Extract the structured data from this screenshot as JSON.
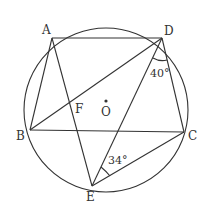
{
  "diagram": {
    "type": "inscribed-polygon",
    "circle": {
      "center_label": "O",
      "cx": 106,
      "cy": 110,
      "r": 82
    },
    "points": {
      "A": {
        "label": "A",
        "x": 52,
        "y": 38
      },
      "D": {
        "label": "D",
        "x": 162,
        "y": 38
      },
      "B": {
        "label": "B",
        "x": 30,
        "y": 130
      },
      "C": {
        "label": "C",
        "x": 184,
        "y": 132
      },
      "E": {
        "label": "E",
        "x": 92,
        "y": 186
      },
      "F": {
        "label": "F"
      }
    },
    "segments": [
      "AD",
      "AB",
      "AE",
      "BD",
      "BC",
      "DC",
      "DE",
      "EC"
    ],
    "angles": [
      {
        "vertex": "D",
        "between": [
          "E",
          "C"
        ],
        "value": "40°"
      },
      {
        "vertex": "E",
        "between": [
          "D",
          "C"
        ],
        "value": "34°"
      }
    ]
  }
}
